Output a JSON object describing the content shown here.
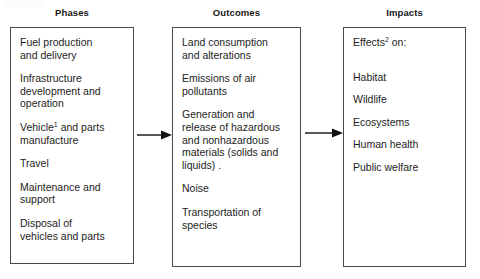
{
  "figure": {
    "type": "flow-diagram",
    "direction": "left-to-right",
    "columns": [
      {
        "id": "phases",
        "heading": "Phases",
        "items": [
          "Fuel production\nand delivery",
          "Infrastructure\ndevelopment and\noperation",
          "Vehicle¹ and parts\nmanufacture",
          "Travel",
          "Maintenance and\nsupport",
          "Disposal of\nvehicles and parts"
        ],
        "items_plain": [
          "Fuel production and delivery",
          "Infrastructure development and operation",
          "Vehicle1 and parts manufacture",
          "Travel",
          "Maintenance and support",
          "Disposal of vehicles and parts"
        ]
      },
      {
        "id": "outcomes",
        "heading": "Outcomes",
        "items": [
          "Land consumption\nand alterations",
          "Emissions of air\npollutants",
          "Generation and\nrelease of hazardous\nand nonhazardous\nmaterials (solids and\nliquids) .",
          "Noise",
          "Transportation of\nspecies"
        ],
        "items_plain": [
          "Land consumption and alterations",
          "Emissions of air pollutants",
          "Generation and release of hazardous and nonhazardous materials (solids and liquids) .",
          "Noise",
          "Transportation of species"
        ]
      },
      {
        "id": "impacts",
        "heading": "Impacts",
        "items": [
          "Effects² on:",
          "Habitat",
          "Wildlife",
          "Ecosystems",
          "Human health",
          "Public welfare"
        ],
        "items_plain": [
          "Effects2 on:",
          "Habitat",
          "Wildlife",
          "Ecosystems",
          "Human health",
          "Public welfare"
        ]
      }
    ],
    "connectors": [
      {
        "id": "arrow-phases-to-outcomes",
        "glyph": "right-arrow",
        "from": "phases",
        "to": "outcomes"
      },
      {
        "id": "arrow-outcomes-to-impacts",
        "glyph": "right-arrow",
        "from": "outcomes",
        "to": "impacts"
      }
    ],
    "footnote_markers": [
      "1",
      "2"
    ],
    "colors": {
      "background": "#ffffff",
      "text": "#1d1d1d",
      "heading": "#171717",
      "box_border": "#4a4a4a",
      "arrow": "#111111"
    }
  }
}
